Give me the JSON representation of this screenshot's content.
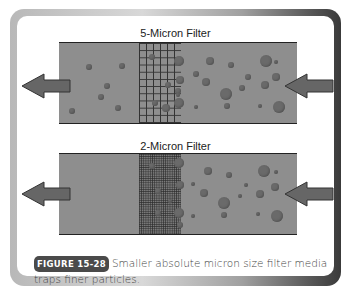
{
  "figure": {
    "badge": "FIGURE 15-28",
    "caption": "Smaller absolute micron size filter media traps finer particles."
  },
  "panels": [
    {
      "title": "5-Micron Filter",
      "filter_type": "coarse",
      "flow_direction": "right-to-left",
      "downstream_particles": [
        [
          89,
          67,
          3
        ],
        [
          122,
          66,
          3
        ],
        [
          107,
          86,
          3
        ],
        [
          101,
          97,
          3
        ],
        [
          118,
          108,
          3
        ],
        [
          72,
          111,
          3
        ]
      ],
      "trapped_particles": [
        [
          152,
          57,
          3
        ],
        [
          179,
          61,
          5
        ],
        [
          180,
          80,
          4
        ],
        [
          168,
          85,
          3
        ],
        [
          178,
          91,
          3
        ],
        [
          179,
          103,
          5
        ],
        [
          155,
          103,
          3
        ],
        [
          166,
          108,
          4
        ],
        [
          178,
          95,
          2
        ]
      ],
      "upstream_particles": [
        [
          210,
          61,
          4
        ],
        [
          231,
          65,
          3
        ],
        [
          266,
          61,
          6
        ],
        [
          276,
          62,
          2
        ],
        [
          196,
          74,
          3
        ],
        [
          248,
          77,
          3
        ],
        [
          276,
          77,
          4
        ],
        [
          206,
          82,
          4
        ],
        [
          226,
          94,
          6
        ],
        [
          242,
          88,
          3
        ],
        [
          265,
          85,
          4
        ],
        [
          196,
          107,
          2
        ],
        [
          227,
          106,
          3
        ],
        [
          260,
          106,
          2
        ],
        [
          279,
          107,
          6
        ]
      ]
    },
    {
      "title": "2-Micron Filter",
      "filter_type": "fine",
      "flow_direction": "right-to-left",
      "downstream_particles": [],
      "trapped_particles": [
        [
          152,
          166,
          3
        ],
        [
          179,
          163,
          5
        ],
        [
          180,
          185,
          4
        ],
        [
          158,
          191,
          3
        ],
        [
          170,
          201,
          2
        ],
        [
          179,
          213,
          5
        ],
        [
          158,
          213,
          3
        ],
        [
          180,
          225,
          3
        ]
      ],
      "upstream_particles": [
        [
          208,
          171,
          4
        ],
        [
          229,
          175,
          3
        ],
        [
          264,
          171,
          6
        ],
        [
          276,
          172,
          2
        ],
        [
          193,
          184,
          2
        ],
        [
          246,
          185,
          2
        ],
        [
          275,
          187,
          4
        ],
        [
          204,
          193,
          4
        ],
        [
          224,
          203,
          6
        ],
        [
          240,
          196,
          2
        ],
        [
          260,
          194,
          4
        ],
        [
          193,
          216,
          2
        ],
        [
          224,
          215,
          3
        ],
        [
          258,
          214,
          2
        ],
        [
          277,
          216,
          6
        ]
      ]
    }
  ]
}
